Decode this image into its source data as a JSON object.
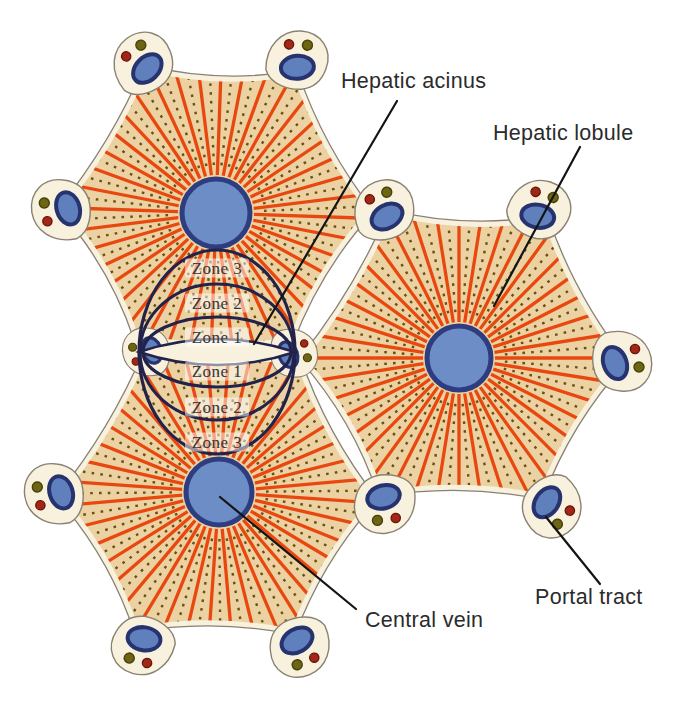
{
  "figure": {
    "annotations": {
      "hepatic_acinus": "Hepatic acinus",
      "hepatic_lobule": "Hepatic lobule",
      "central_vein": "Central vein",
      "portal_tract": "Portal tract"
    },
    "zones": [
      "Zone 3",
      "Zone 2",
      "Zone 1",
      "Zone 1",
      "Zone 2",
      "Zone 3"
    ],
    "colors": {
      "background": "#ffffff",
      "lobule_fill": "#ecd2a2",
      "lobule_margin": "#f8f1dd",
      "lobule_outline": "#8a8173",
      "sinusoid_orange": "#e8480f",
      "dot_olive": "#665211",
      "vein_fill": "#6d8dc6",
      "vein_ring": "#2e3d80",
      "portal_vein_fill": "#5f80bd",
      "portal_vein_ring": "#27336f",
      "artery_red": "#a02818",
      "artery_ring": "#6d1206",
      "bile_duct_olive": "#6d6414",
      "bile_duct_ring": "#474208",
      "acinus_outline": "#22224a",
      "lens_fill": "#f8f1dd",
      "zone_box": "#ffffff",
      "zone_text": "#383838",
      "label_text": "#2b2b2b",
      "leader_line": "#141414"
    }
  }
}
